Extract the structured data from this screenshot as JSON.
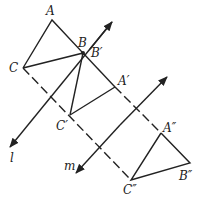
{
  "diagram": {
    "labels": {
      "A": "A",
      "B": "B",
      "B_prime": "B′",
      "C": "C",
      "A_prime": "A′",
      "C_prime": "C′",
      "A_dprime": "A″",
      "B_dprime": "B″",
      "C_dprime": "C″",
      "line_l": "l",
      "line_m": "m"
    },
    "colors": {
      "stroke": "#222222",
      "background": "#ffffff"
    }
  }
}
